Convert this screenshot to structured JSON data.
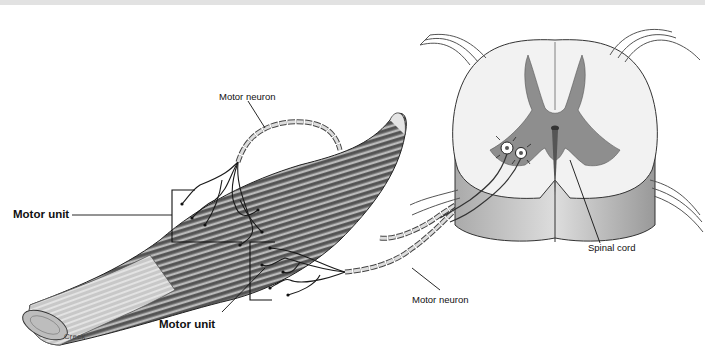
{
  "figure": {
    "labels": {
      "motor_neuron_top": "Motor neuron",
      "motor_neuron_bottom": "Motor neuron",
      "motor_unit_upper": "Motor unit",
      "motor_unit_lower": "Motor unit",
      "spinal_cord": "Spinal cord",
      "credit": "Creek"
    },
    "colors": {
      "muscle_dark": "#5a5a5a",
      "muscle_light": "#d8d8d8",
      "grey_matter": "#8e8e8e",
      "white_matter": "#f2f2f2",
      "outline": "#222222",
      "top_band": "#e2e2e2"
    }
  }
}
